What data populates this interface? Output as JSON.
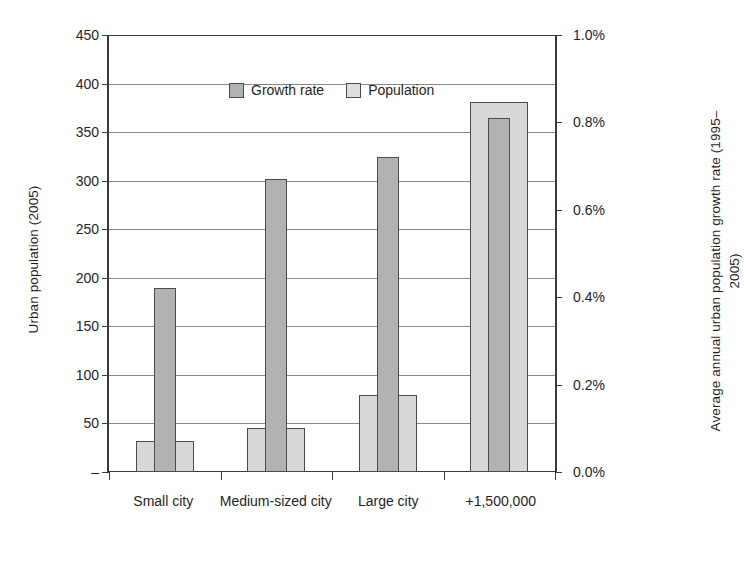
{
  "chart_data": {
    "type": "bar",
    "title": "",
    "subtitle": "",
    "categories": [
      "Small city",
      "Medium-sized city",
      "Large city",
      "+1,500,000"
    ],
    "series": [
      {
        "name": "Population",
        "axis": "left",
        "unit": "Urban population (2005)",
        "values": [
          32,
          45,
          79,
          381
        ],
        "color": "#d8d8d8"
      },
      {
        "name": "Growth rate",
        "axis": "right",
        "unit": "percent",
        "values": [
          0.42,
          0.67,
          0.72,
          0.81
        ],
        "color": "#b2b2b2"
      }
    ],
    "xlabel": "",
    "ylabel": "Urban population (2005)",
    "y2label": "Average annual urban population growth rate (1995–2005)",
    "ylim": [
      0,
      450
    ],
    "y2lim": [
      0,
      1.0
    ],
    "grid": true,
    "legend_position": "top-left-inside"
  },
  "axes": {
    "left": {
      "title": "Urban population (2005)",
      "min": 0,
      "max": 450,
      "step": 50,
      "ticks": [
        {
          "value": 450,
          "label": "450"
        },
        {
          "value": 400,
          "label": "400"
        },
        {
          "value": 350,
          "label": "350"
        },
        {
          "value": 300,
          "label": "300"
        },
        {
          "value": 250,
          "label": "250"
        },
        {
          "value": 200,
          "label": "200"
        },
        {
          "value": 150,
          "label": "150"
        },
        {
          "value": 100,
          "label": "100"
        },
        {
          "value": 50,
          "label": "50"
        },
        {
          "value": 0,
          "label": "–"
        }
      ]
    },
    "right": {
      "title": "Average annual urban population growth rate (1995–2005)",
      "min": 0,
      "max": 1.0,
      "step": 0.2,
      "ticks": [
        {
          "value": 1.0,
          "label": "1.0%"
        },
        {
          "value": 0.8,
          "label": "0.8%"
        },
        {
          "value": 0.6,
          "label": "0.6%"
        },
        {
          "value": 0.4,
          "label": "0.4%"
        },
        {
          "value": 0.2,
          "label": "0.2%"
        },
        {
          "value": 0.0,
          "label": "0.0%"
        }
      ]
    },
    "x": {
      "categories": [
        "Small city",
        "Medium-sized city",
        "Large city",
        "+1,500,000"
      ]
    }
  },
  "legend": {
    "items": [
      {
        "label": "Growth rate",
        "swatch": "growth-swatch",
        "color": "#b2b2b2"
      },
      {
        "label": "Population",
        "swatch": "population-swatch",
        "color": "#dedede"
      }
    ]
  },
  "colors": {
    "growth_rate": "#b2b2b2",
    "population": "#d8d8d8",
    "axis": "#3a3a3a",
    "grid": "#8a8a8a",
    "text": "#1f1f1f",
    "background": "#ffffff"
  }
}
